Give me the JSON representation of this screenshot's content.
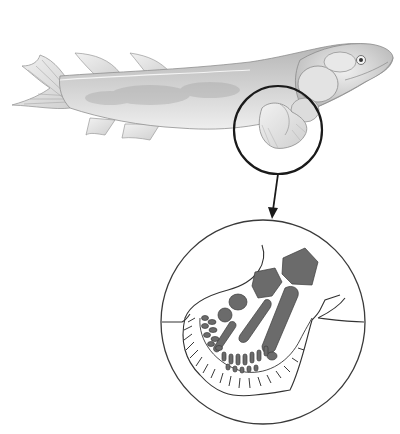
{
  "figure": {
    "colors": {
      "background": "#ffffff",
      "body_light": "#e6e6e6",
      "body_mid": "#c8c8c8",
      "body_dark": "#a9a9a9",
      "outline": "#3a3a3a",
      "bone_fill": "#6b6b6b",
      "callout_stroke": "#1a1a1a"
    },
    "callout": {
      "small_circle": {
        "cx": 278,
        "cy": 130,
        "r": 44
      },
      "arrow": {
        "x1": 278,
        "y1": 174,
        "x2": 272,
        "y2": 218
      },
      "large_circle": {
        "cx": 263,
        "cy": 322,
        "r": 102
      }
    }
  }
}
